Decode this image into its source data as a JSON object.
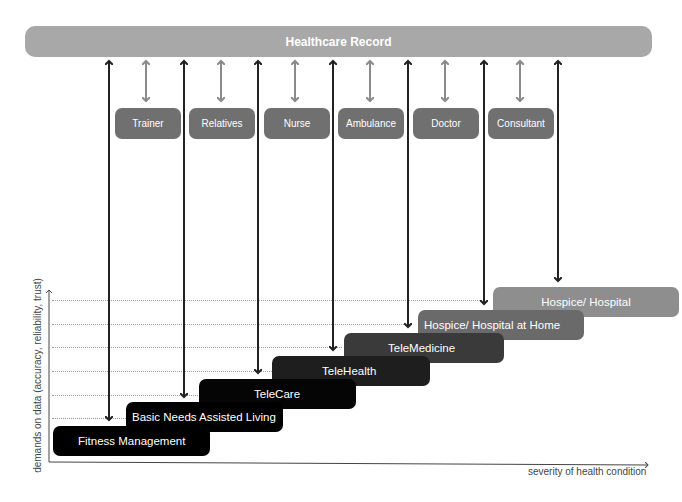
{
  "header": {
    "title": "Healthcare Record"
  },
  "actors": [
    {
      "label": "Trainer"
    },
    {
      "label": "Relatives"
    },
    {
      "label": "Nurse"
    },
    {
      "label": "Ambulance"
    },
    {
      "label": "Doctor"
    },
    {
      "label": "Consultant"
    }
  ],
  "steps": [
    {
      "label": "Fitness Management",
      "color": "#000000"
    },
    {
      "label": "Basic Needs Assisted Living",
      "color": "#000000"
    },
    {
      "label": "TeleCare",
      "color": "#050505"
    },
    {
      "label": "TeleHealth",
      "color": "#1e1e1e"
    },
    {
      "label": "TeleMedicine",
      "color": "#3a3a3a"
    },
    {
      "label": "Hospice/ Hospital at Home",
      "color": "#6a6a6a"
    },
    {
      "label": "Hospice/ Hospital",
      "color": "#8e8e8e"
    }
  ],
  "axes": {
    "y_label": "demands on data (accuracy, reliability, trust)",
    "x_label": "severity of health condition"
  },
  "colors": {
    "record_bar": "#a8a8a8",
    "actor_box": "#707070",
    "actor_arrow": "#8a8a8a",
    "step_arrow": "#222222"
  }
}
